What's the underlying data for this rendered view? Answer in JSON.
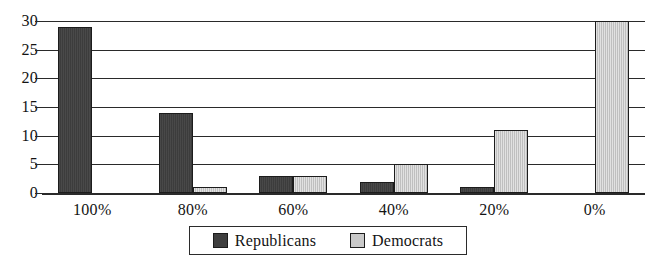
{
  "chart_data": {
    "type": "bar",
    "title": "",
    "subtitle": "",
    "xlabel": "",
    "ylabel": "",
    "categories": [
      "100%",
      "80%",
      "60%",
      "40%",
      "20%",
      "0%"
    ],
    "series": [
      {
        "name": "Republicans",
        "color": "#3f3f3f",
        "values": [
          29,
          14,
          3,
          2,
          1,
          0
        ]
      },
      {
        "name": "Democrats",
        "color": "#c9c9c9",
        "values": [
          0,
          1,
          3,
          5,
          11,
          30
        ]
      }
    ],
    "ylim": [
      0,
      30
    ],
    "yticks": [
      0,
      5,
      10,
      15,
      20,
      25,
      30
    ],
    "ytick_labels": [
      "0",
      "5",
      "10",
      "15",
      "20",
      "25",
      "30"
    ],
    "grid": true,
    "grid_axis": "y",
    "legend_position": "bottom-center",
    "legend_entries": [
      "Republicans",
      "Democrats"
    ],
    "background_color": "#ffffff",
    "axis_color": "#2a2a2a"
  }
}
